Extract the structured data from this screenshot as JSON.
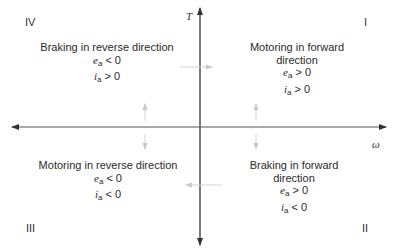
{
  "diagram": {
    "axes": {
      "vertical_label": "T",
      "horizontal_label": "ω"
    },
    "colors": {
      "axis": "#333333",
      "faint_arrow": "#c8c8c8",
      "text": "#2a2a2a"
    },
    "quadrants": [
      {
        "numeral": "I",
        "title": "Motoring in forward direction",
        "ea_var": "e",
        "ea_sub": "a",
        "ea_cond": " > 0",
        "ia_var": "i",
        "ia_sub": "a",
        "ia_cond": " > 0"
      },
      {
        "numeral": "II",
        "title": "Braking in forward direction",
        "ea_var": "e",
        "ea_sub": "a",
        "ea_cond": " > 0",
        "ia_var": "i",
        "ia_sub": "a",
        "ia_cond": " < 0"
      },
      {
        "numeral": "III",
        "title": "Motoring in reverse direction",
        "ea_var": "e",
        "ea_sub": "a",
        "ea_cond": " < 0",
        "ia_var": "i",
        "ia_sub": "a",
        "ia_cond": " < 0"
      },
      {
        "numeral": "IV",
        "title": "Braking in reverse direction",
        "ea_var": "e",
        "ea_sub": "a",
        "ea_cond": " < 0",
        "ia_var": "i",
        "ia_sub": "a",
        "ia_cond": " > 0"
      }
    ]
  }
}
